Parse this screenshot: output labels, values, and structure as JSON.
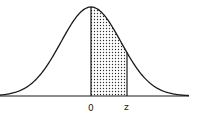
{
  "chart_data": {
    "type": "area",
    "title": "",
    "xlabel": "",
    "ylabel": "",
    "tick_labels": [
      "0",
      "z"
    ],
    "shaded_region": {
      "from": "0",
      "to": "z",
      "pattern": "dotted"
    },
    "curve": "standard normal density",
    "x_range": [
      -3,
      3
    ],
    "z_value_approx": 0.8,
    "grid": false,
    "legend": null
  },
  "labels": {
    "zero": "0",
    "z": "z"
  },
  "colors": {
    "line": "#1a1a1a",
    "fill_dots": "#333333",
    "background": "#ffffff"
  }
}
